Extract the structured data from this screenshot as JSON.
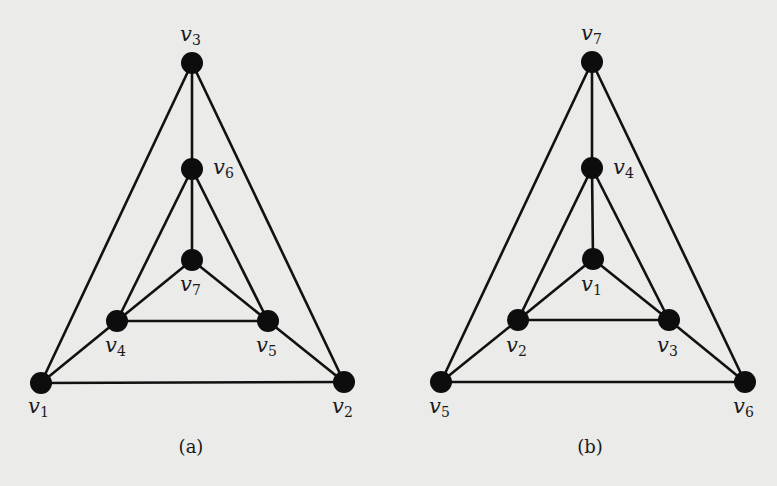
{
  "figure": {
    "background": "#ebebea",
    "edge_color": "#111111",
    "node_color": "#0d0d0d",
    "panels": [
      {
        "id": "a",
        "caption": "(a)",
        "caption_pos": [
          191,
          453
        ],
        "nodes": [
          {
            "id": "v1",
            "label": "v",
            "sub": "1",
            "x": 41,
            "y": 383,
            "lx": 28,
            "ly": 413
          },
          {
            "id": "v2",
            "label": "v",
            "sub": "2",
            "x": 344,
            "y": 382,
            "lx": 332,
            "ly": 413
          },
          {
            "id": "v3",
            "label": "v",
            "sub": "3",
            "x": 192,
            "y": 63,
            "lx": 180,
            "ly": 41
          },
          {
            "id": "v4",
            "label": "v",
            "sub": "4",
            "x": 117,
            "y": 321,
            "lx": 105,
            "ly": 352
          },
          {
            "id": "v5",
            "label": "v",
            "sub": "5",
            "x": 268,
            "y": 321,
            "lx": 256,
            "ly": 352
          },
          {
            "id": "v6",
            "label": "v",
            "sub": "6",
            "x": 192,
            "y": 169,
            "lx": 213,
            "ly": 174
          },
          {
            "id": "v7",
            "label": "v",
            "sub": "7",
            "x": 192,
            "y": 260,
            "lx": 180,
            "ly": 291
          }
        ],
        "edges": [
          [
            "v1",
            "v2"
          ],
          [
            "v1",
            "v3"
          ],
          [
            "v2",
            "v3"
          ],
          [
            "v1",
            "v4"
          ],
          [
            "v2",
            "v5"
          ],
          [
            "v3",
            "v6"
          ],
          [
            "v4",
            "v5"
          ],
          [
            "v4",
            "v6"
          ],
          [
            "v5",
            "v6"
          ],
          [
            "v4",
            "v7"
          ],
          [
            "v5",
            "v7"
          ],
          [
            "v6",
            "v7"
          ]
        ]
      },
      {
        "id": "b",
        "caption": "(b)",
        "caption_pos": [
          590,
          453
        ],
        "nodes": [
          {
            "id": "v1",
            "label": "v",
            "sub": "1",
            "x": 593,
            "y": 259,
            "lx": 581,
            "ly": 291
          },
          {
            "id": "v2",
            "label": "v",
            "sub": "2",
            "x": 518,
            "y": 320,
            "lx": 506,
            "ly": 352
          },
          {
            "id": "v3",
            "label": "v",
            "sub": "3",
            "x": 669,
            "y": 320,
            "lx": 657,
            "ly": 352
          },
          {
            "id": "v4",
            "label": "v",
            "sub": "4",
            "x": 592,
            "y": 168,
            "lx": 613,
            "ly": 174
          },
          {
            "id": "v5",
            "label": "v",
            "sub": "5",
            "x": 441,
            "y": 382,
            "lx": 429,
            "ly": 413
          },
          {
            "id": "v6",
            "label": "v",
            "sub": "6",
            "x": 745,
            "y": 382,
            "lx": 733,
            "ly": 413
          },
          {
            "id": "v7",
            "label": "v",
            "sub": "7",
            "x": 592,
            "y": 62,
            "lx": 581,
            "ly": 40
          }
        ],
        "edges": [
          [
            "v5",
            "v6"
          ],
          [
            "v5",
            "v7"
          ],
          [
            "v6",
            "v7"
          ],
          [
            "v5",
            "v2"
          ],
          [
            "v6",
            "v3"
          ],
          [
            "v7",
            "v4"
          ],
          [
            "v2",
            "v3"
          ],
          [
            "v2",
            "v4"
          ],
          [
            "v3",
            "v4"
          ],
          [
            "v2",
            "v1"
          ],
          [
            "v3",
            "v1"
          ],
          [
            "v4",
            "v1"
          ]
        ]
      }
    ]
  }
}
